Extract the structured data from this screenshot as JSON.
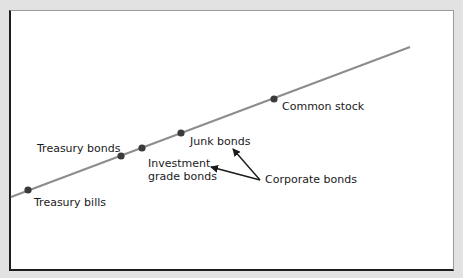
{
  "diagram": {
    "type": "risk-return line",
    "line_color": "#8c8c8c",
    "point_color": "#3a3a3a",
    "arrow_color": "#1a1a1a",
    "points": [
      {
        "id": "treasury-bills",
        "label": "Treasury bills"
      },
      {
        "id": "treasury-bonds",
        "label": "Treasury bonds"
      },
      {
        "id": "investment-grade-bonds",
        "label_line1": "Investment",
        "label_line2": "grade bonds"
      },
      {
        "id": "junk-bonds",
        "label": "Junk bonds"
      },
      {
        "id": "common-stock",
        "label": "Common stock"
      }
    ],
    "group_label": "Corporate bonds"
  }
}
